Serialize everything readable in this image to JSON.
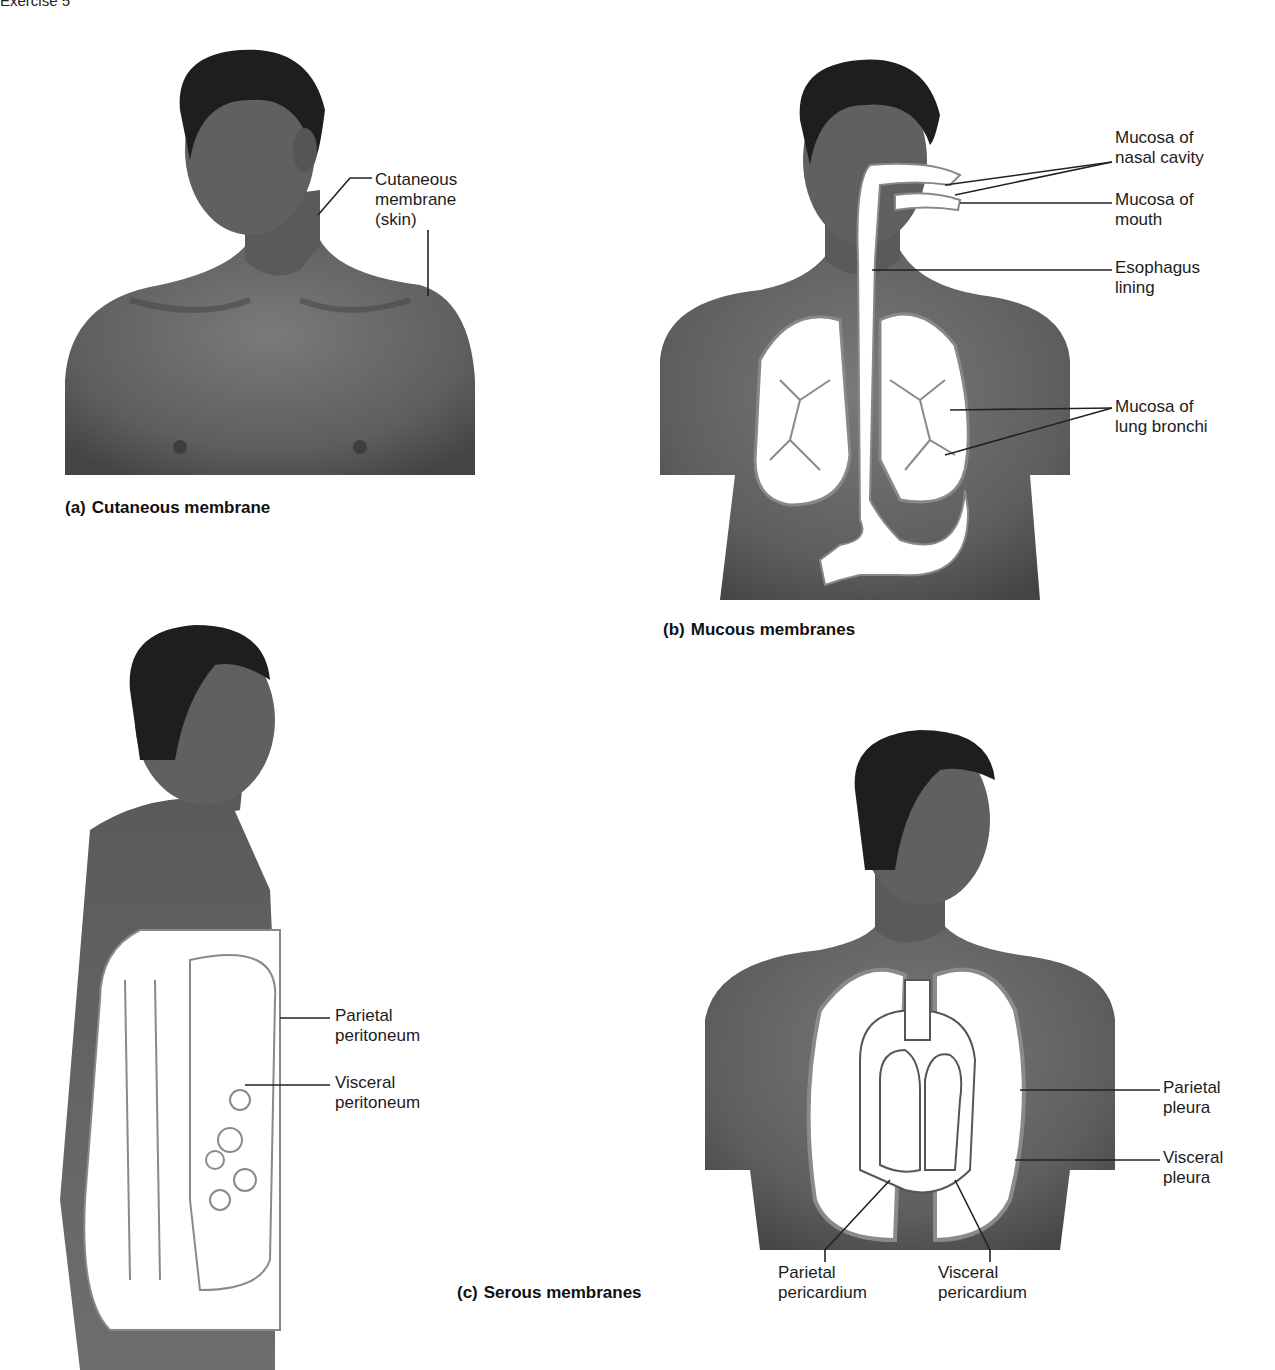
{
  "page": {
    "header": "Exercise 5"
  },
  "figure_a": {
    "caption_letter": "(a)",
    "caption": "Cutaneous membrane",
    "labels": [
      {
        "line1": "Cutaneous",
        "line2": "membrane",
        "line3": "(skin)"
      }
    ]
  },
  "figure_b": {
    "caption_letter": "(b)",
    "caption": "Mucous membranes",
    "labels": [
      {
        "line1": "Mucosa of",
        "line2": "nasal cavity"
      },
      {
        "line1": "Mucosa of",
        "line2": "mouth"
      },
      {
        "line1": "Esophagus",
        "line2": "lining"
      },
      {
        "line1": "Mucosa of",
        "line2": "lung bronchi"
      }
    ]
  },
  "figure_c": {
    "caption_letter": "(c)",
    "caption": "Serous membranes",
    "left_labels": [
      {
        "line1": "Parietal",
        "line2": "peritoneum"
      },
      {
        "line1": "Visceral",
        "line2": "peritoneum"
      }
    ],
    "right_labels": [
      {
        "line1": "Parietal",
        "line2": "pleura"
      },
      {
        "line1": "Visceral",
        "line2": "pleura"
      }
    ],
    "bottom_labels": [
      {
        "line1": "Parietal",
        "line2": "pericardium"
      },
      {
        "line1": "Visceral",
        "line2": "pericardium"
      }
    ]
  },
  "colors": {
    "skin": "#6b6b6b",
    "skin_dark": "#4a4a4a",
    "hair": "#1e1e1e",
    "organ_fill": "#ffffff",
    "membrane_line": "#8a8a8a",
    "leader_line": "#222222"
  }
}
